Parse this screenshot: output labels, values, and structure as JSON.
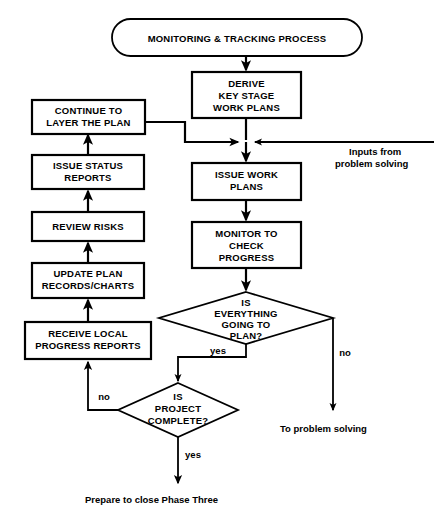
{
  "diagram": {
    "title_terminator": "MONITORING  &  TRACKING PROCESS",
    "nodes": {
      "derive": "DERIVE\nKEY STAGE\nWORK PLANS",
      "derive_l1": "DERIVE",
      "derive_l2": "KEY STAGE",
      "derive_l3": "WORK PLANS",
      "continue_l1": "CONTINUE TO",
      "continue_l2": "LAYER THE PLAN",
      "issue_status_l1": "ISSUE STATUS",
      "issue_status_l2": "REPORTS",
      "review_risks_l1": "REVIEW RISKS",
      "update_plan_l1": "UPDATE PLAN",
      "update_plan_l2": "RECORDS/CHARTS",
      "receive_local_l1": "RECEIVE LOCAL",
      "receive_local_l2": "PROGRESS REPORTS",
      "issue_work_l1": "ISSUE WORK",
      "issue_work_l2": "PLANS",
      "monitor_l1": "MONITOR TO",
      "monitor_l2": "CHECK",
      "monitor_l3": "PROGRESS",
      "decision1_l1": "IS",
      "decision1_l2": "EVERYTHING",
      "decision1_l3": "GOING TO",
      "decision1_l4": "PLAN?",
      "decision2_l1": "IS",
      "decision2_l2": "PROJECT",
      "decision2_l3": "COMPLETE?"
    },
    "labels": {
      "inputs_l1": "Inputs from",
      "inputs_l2": "problem solving",
      "yes_decision1": "yes",
      "no_decision1": "no",
      "yes_decision2": "yes",
      "no_decision2": "no",
      "to_problem_solving": "To problem solving",
      "prepare_close": "Prepare to close Phase Three"
    },
    "colors": {
      "stroke": "#000000",
      "fill": "#ffffff",
      "text": "#000000"
    }
  }
}
